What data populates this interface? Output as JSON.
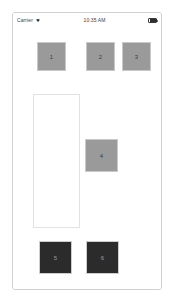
{
  "device": {
    "name": "iphone-simulator-frame"
  },
  "status_bar": {
    "carrier": "Carrier",
    "wifi_icon": "wifi-icon",
    "time": "10:35 AM",
    "battery_icon": "battery-full-icon"
  },
  "content": {
    "panel": {
      "name": "content-panel",
      "label": "",
      "x": 20,
      "y": 67,
      "width": 47,
      "height": 134,
      "border_color": "#e2e2e2",
      "background": "#ffffff"
    },
    "tiles": [
      {
        "label": "1",
        "style": "gray",
        "color": "#9a9a9a",
        "x": 24,
        "y": 15,
        "size": 29
      },
      {
        "label": "2",
        "style": "gray",
        "color": "#9a9a9a",
        "x": 73,
        "y": 15,
        "size": 29
      },
      {
        "label": "3",
        "style": "gray",
        "color": "#9a9a9a",
        "x": 109,
        "y": 15,
        "size": 29
      },
      {
        "label": "4",
        "style": "gray",
        "color": "#9a9a9a",
        "x": 72,
        "y": 112,
        "size": 33
      },
      {
        "label": "5",
        "style": "dark",
        "color": "#2b2b2b",
        "x": 26,
        "y": 214,
        "size": 33
      },
      {
        "label": "6",
        "style": "dark",
        "color": "#2b2b2b",
        "x": 73,
        "y": 214,
        "size": 33
      }
    ]
  },
  "colors": {
    "frame_border": "#d0d0d2",
    "tile_gray": "#9a9a9a",
    "tile_dark": "#2b2b2b",
    "panel_border": "#e2e2e2",
    "background": "#ffffff"
  }
}
